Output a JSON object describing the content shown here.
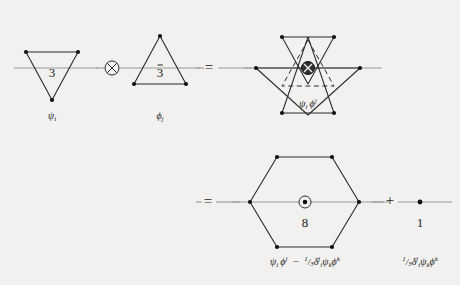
{
  "figure": {
    "background_color": "#f2f1ef",
    "ink_color": "#1b1b1b",
    "axis_color": "#8f8f8f",
    "rows": [
      {
        "id": "row-1",
        "terms": [
          {
            "id": "term-3",
            "shape": "triangle-down",
            "rep_label": "3",
            "rep_overbar": false,
            "field_label": "ψ",
            "field_index": "i",
            "field_index_position": "sub"
          },
          {
            "id": "term-3bar",
            "shape": "triangle-up",
            "rep_label": "3",
            "rep_overbar": true,
            "field_label": "ϕ",
            "field_index": "j",
            "field_index_position": "sub"
          },
          {
            "id": "term-product",
            "shape": "star-of-david",
            "rep_label": "",
            "field_label": "ψ",
            "field_index": "i",
            "product_label": "ψᵢϕʲ"
          }
        ]
      },
      {
        "id": "row-2",
        "terms": [
          {
            "id": "term-8",
            "shape": "hexagon",
            "rep_label": "8",
            "center_symbol": "circle-dot",
            "caption": "ψᵢϕʲ − ⅓ δʲᵢ ψₖϕᵏ"
          },
          {
            "id": "term-1",
            "shape": "point",
            "rep_label": "1",
            "caption": "⅓ δʲᵢ ψₖϕᵏ"
          }
        ]
      }
    ],
    "operators": {
      "tensor": "⊗",
      "equals_row1": "=",
      "equals_row2": "=",
      "plus": "+"
    },
    "labels": {
      "rep_3": "3",
      "rep_3bar": "3",
      "rep_8": "8",
      "rep_1": "1",
      "psi_i": "ψ",
      "psi_i_index": "i",
      "phi_j": "ϕ",
      "phi_j_index": "j",
      "product_psi": "ψ",
      "product_psi_index": "i",
      "product_phi": "ϕ",
      "product_phi_index": "j",
      "octet_caption_a_psi": "ψ",
      "octet_caption_a_psi_idx": "i",
      "octet_caption_a_phi": "ϕ",
      "octet_caption_a_phi_idx": "j",
      "octet_caption_minus": "−",
      "octet_frac_num": "1",
      "octet_frac_den": "3",
      "octet_delta": "δ",
      "octet_delta_sup": "j",
      "octet_delta_sub": "i",
      "octet_psi_k": "ψ",
      "octet_psi_k_idx": "k",
      "octet_phi_k": "ϕ",
      "octet_phi_k_idx": "k",
      "singlet_frac_num": "1",
      "singlet_frac_den": "3",
      "singlet_delta": "δ",
      "singlet_delta_sup": "j",
      "singlet_delta_sub": "i",
      "singlet_psi_k": "ψ",
      "singlet_psi_k_idx": "k",
      "singlet_phi_k": "ϕ",
      "singlet_phi_k_idx": "k"
    }
  }
}
